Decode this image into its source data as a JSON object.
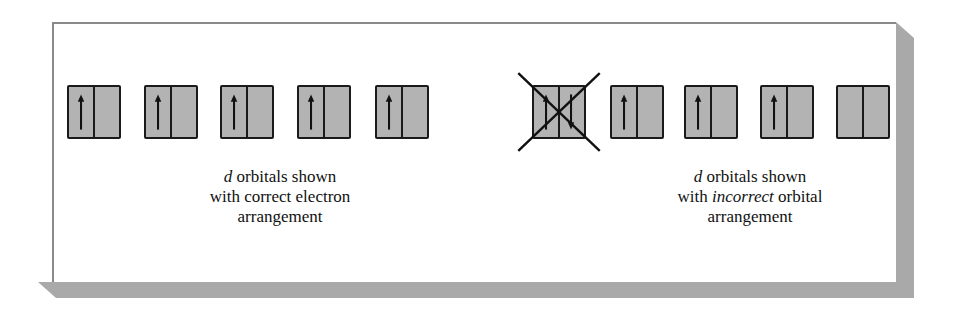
{
  "figure": {
    "colors": {
      "box_fill": "#b3b3b3",
      "box_stroke": "#1a1a1a",
      "panel_border": "#8a8a8a",
      "shadow": "#a9a9a9"
    },
    "left_group": {
      "caption": {
        "line1_italic": "d",
        "line1_rest": " orbitals shown",
        "line2": "with correct electron",
        "line3": "arrangement"
      },
      "orbitals": [
        {
          "left_arrow": "up",
          "right_arrow": "none"
        },
        {
          "left_arrow": "up",
          "right_arrow": "none"
        },
        {
          "left_arrow": "up",
          "right_arrow": "none"
        },
        {
          "left_arrow": "up",
          "right_arrow": "none"
        },
        {
          "left_arrow": "up",
          "right_arrow": "none"
        }
      ]
    },
    "right_group": {
      "caption": {
        "line1_italic": "d",
        "line1_rest": " orbitals shown",
        "line2_pre": "with ",
        "line2_italic": "incorrect",
        "line2_post": " orbital",
        "line3": "arrangement"
      },
      "orbitals": [
        {
          "left_arrow": "up",
          "right_arrow": "down",
          "crossed_out": true
        },
        {
          "left_arrow": "up",
          "right_arrow": "none"
        },
        {
          "left_arrow": "up",
          "right_arrow": "none"
        },
        {
          "left_arrow": "up",
          "right_arrow": "none"
        },
        {
          "left_arrow": "none",
          "right_arrow": "none"
        }
      ]
    }
  }
}
